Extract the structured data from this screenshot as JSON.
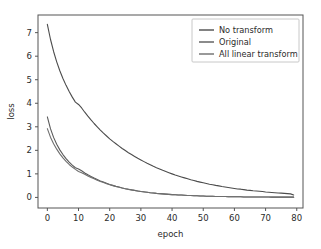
{
  "chart_data": {
    "type": "line",
    "title": "",
    "xlabel": "epoch",
    "ylabel": "loss",
    "xlim": [
      -3,
      82
    ],
    "ylim": [
      -0.45,
      7.75
    ],
    "xticks": [
      0,
      10,
      20,
      30,
      40,
      50,
      60,
      70,
      80
    ],
    "xticklabels": [
      "0",
      "10",
      "20",
      "30",
      "40",
      "50",
      "60",
      "70",
      "80"
    ],
    "yticks": [
      0,
      1,
      2,
      3,
      4,
      5,
      6,
      7
    ],
    "yticklabels": [
      "0",
      "1",
      "2",
      "3",
      "4",
      "5",
      "6",
      "7"
    ],
    "grid": false,
    "legend_position": "upper right",
    "x": [
      0,
      1,
      2,
      3,
      4,
      5,
      6,
      7,
      8,
      9,
      10,
      11,
      12,
      13,
      14,
      15,
      16,
      17,
      18,
      19,
      20,
      21,
      22,
      23,
      24,
      25,
      26,
      27,
      28,
      29,
      30,
      31,
      32,
      33,
      34,
      35,
      36,
      37,
      38,
      39,
      40,
      41,
      42,
      43,
      44,
      45,
      46,
      47,
      48,
      49,
      50,
      51,
      52,
      53,
      54,
      55,
      56,
      57,
      58,
      59,
      60,
      61,
      62,
      63,
      64,
      65,
      66,
      67,
      68,
      69,
      70,
      71,
      72,
      73,
      74,
      75,
      76,
      77,
      78,
      79
    ],
    "series": [
      {
        "name": "No transform",
        "color": "#4c4c4c",
        "values": [
          7.35,
          6.72,
          6.2,
          5.76,
          5.38,
          5.05,
          4.76,
          4.5,
          4.26,
          4.05,
          3.95,
          3.8,
          3.62,
          3.45,
          3.29,
          3.14,
          3.0,
          2.86,
          2.73,
          2.61,
          2.49,
          2.38,
          2.28,
          2.18,
          2.08,
          1.99,
          1.9,
          1.82,
          1.74,
          1.66,
          1.59,
          1.52,
          1.45,
          1.39,
          1.32,
          1.26,
          1.21,
          1.15,
          1.1,
          1.05,
          1.0,
          0.95,
          0.91,
          0.87,
          0.83,
          0.79,
          0.75,
          0.72,
          0.68,
          0.65,
          0.62,
          0.59,
          0.56,
          0.54,
          0.51,
          0.49,
          0.46,
          0.44,
          0.42,
          0.4,
          0.38,
          0.36,
          0.35,
          0.33,
          0.31,
          0.3,
          0.28,
          0.27,
          0.26,
          0.25,
          0.23,
          0.22,
          0.21,
          0.2,
          0.19,
          0.18,
          0.17,
          0.16,
          0.15,
          0.1
        ]
      },
      {
        "name": "Original",
        "color": "#5a5a5a",
        "values": [
          3.42,
          2.92,
          2.55,
          2.26,
          2.02,
          1.82,
          1.65,
          1.5,
          1.37,
          1.26,
          1.21,
          1.13,
          1.04,
          0.96,
          0.89,
          0.82,
          0.76,
          0.7,
          0.65,
          0.6,
          0.55,
          0.51,
          0.47,
          0.44,
          0.4,
          0.37,
          0.35,
          0.32,
          0.3,
          0.27,
          0.25,
          0.24,
          0.22,
          0.2,
          0.19,
          0.17,
          0.16,
          0.15,
          0.14,
          0.13,
          0.12,
          0.11,
          0.1,
          0.1,
          0.09,
          0.08,
          0.08,
          0.07,
          0.07,
          0.06,
          0.06,
          0.05,
          0.05,
          0.05,
          0.04,
          0.04,
          0.04,
          0.04,
          0.03,
          0.03,
          0.03,
          0.03,
          0.03,
          0.02,
          0.02,
          0.02,
          0.02,
          0.02,
          0.02,
          0.02,
          0.02,
          0.02,
          0.01,
          0.01,
          0.01,
          0.01,
          0.01,
          0.01,
          0.01,
          0.01
        ]
      },
      {
        "name": "All linear transform",
        "color": "#6e6e6e",
        "values": [
          2.92,
          2.56,
          2.28,
          2.05,
          1.85,
          1.68,
          1.53,
          1.4,
          1.29,
          1.19,
          1.1,
          1.05,
          0.98,
          0.91,
          0.85,
          0.79,
          0.73,
          0.68,
          0.63,
          0.58,
          0.54,
          0.5,
          0.46,
          0.43,
          0.4,
          0.37,
          0.34,
          0.32,
          0.29,
          0.27,
          0.25,
          0.23,
          0.22,
          0.2,
          0.19,
          0.17,
          0.16,
          0.15,
          0.14,
          0.13,
          0.12,
          0.11,
          0.1,
          0.1,
          0.09,
          0.08,
          0.08,
          0.07,
          0.07,
          0.06,
          0.06,
          0.05,
          0.05,
          0.05,
          0.04,
          0.04,
          0.04,
          0.04,
          0.03,
          0.03,
          0.03,
          0.03,
          0.03,
          0.02,
          0.02,
          0.02,
          0.02,
          0.02,
          0.02,
          0.02,
          0.02,
          0.02,
          0.01,
          0.01,
          0.01,
          0.01,
          0.01,
          0.01,
          0.01,
          0.01
        ]
      }
    ],
    "legend_entries": [
      "No transform",
      "Original",
      "All linear transform"
    ]
  },
  "colors": {
    "background": "#ffffff",
    "axis": "#555555",
    "text": "#2b2b2b",
    "legend_border": "#c8c8c8"
  }
}
